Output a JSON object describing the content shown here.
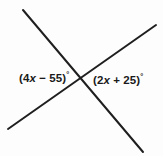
{
  "figure": {
    "name": "intersecting-lines-vertical-angles",
    "background_color": "#fdfdfd",
    "line_color": "#1f1f1f",
    "text_color": "#1a1a1a",
    "labels": {
      "left": {
        "full_text": "(4x − 55)°",
        "open_paren": "(",
        "coefficient": "4",
        "variable": "x",
        "operator": " − ",
        "constant": "55",
        "close_paren": ")",
        "degree": "°"
      },
      "right": {
        "full_text": "(2x + 25)°",
        "open_paren": "(",
        "coefficient": "2",
        "variable": "x",
        "operator": " + ",
        "constant": "25",
        "close_paren": ")",
        "degree": "°"
      }
    },
    "geometry": {
      "intersection": {
        "x": 82,
        "y": 76
      },
      "line_1": {
        "name": "line-down-right",
        "x1": 23,
        "y1": 10,
        "x2": 143,
        "y2": 152
      },
      "line_2": {
        "name": "line-up-right",
        "x1": 8,
        "y1": 129,
        "x2": 156,
        "y2": 25
      },
      "stroke_width": 2
    }
  }
}
